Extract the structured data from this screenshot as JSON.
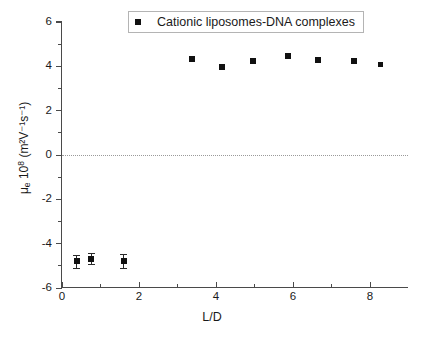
{
  "figure": {
    "legend": {
      "entries": [
        {
          "label": "Cationic liposomes-DNA complexes",
          "marker": "filled-square",
          "color": "#111111"
        }
      ]
    },
    "axes": {
      "x": {
        "title": "L/D",
        "major_ticks": [
          0,
          2,
          4,
          6,
          8
        ],
        "minor_ticks": [
          1,
          3,
          5,
          7
        ],
        "range": [
          0,
          9
        ]
      },
      "y": {
        "title_parts": {
          "symbol": "μ",
          "subscript": "e",
          "factor": "10",
          "exponent": "8",
          "units": "(m²V⁻¹s⁻¹)"
        },
        "title_plain": "μₑ 10⁸ (m²V⁻¹s⁻¹)",
        "major_ticks": [
          -6,
          -4,
          -2,
          0,
          2,
          4,
          6
        ],
        "minor_ticks": [
          -5,
          -3,
          -1,
          1,
          3,
          5
        ],
        "range": [
          -6,
          6
        ]
      }
    },
    "zero_reference_line": {
      "value": 0,
      "style": "dotted",
      "color": "#9a9a9a"
    }
  },
  "chart_data": {
    "type": "scatter",
    "title": "",
    "xlabel": "L/D",
    "ylabel": "μₑ 10⁸ (m²V⁻¹s⁻¹)",
    "xlim": [
      0,
      9
    ],
    "ylim": [
      -6,
      6
    ],
    "grid": false,
    "legend_position": "top-center",
    "series": [
      {
        "name": "Cationic liposomes-DNA complexes",
        "marker": "filled-square",
        "color": "#111111",
        "points": [
          {
            "x": 0.38,
            "y": -4.8,
            "yerr": 0.28
          },
          {
            "x": 0.76,
            "y": -4.68,
            "yerr": 0.25
          },
          {
            "x": 1.6,
            "y": -4.78,
            "yerr": 0.3
          },
          {
            "x": 3.38,
            "y": 4.35,
            "yerr": 0.0
          },
          {
            "x": 4.15,
            "y": 3.95,
            "yerr": 0.0
          },
          {
            "x": 4.96,
            "y": 4.22,
            "yerr": 0.0
          },
          {
            "x": 5.86,
            "y": 4.45,
            "yerr": 0.0
          },
          {
            "x": 6.65,
            "y": 4.28,
            "yerr": 0.0
          },
          {
            "x": 7.58,
            "y": 4.25,
            "yerr": 0.0
          },
          {
            "x": 8.28,
            "y": 4.1,
            "yerr": 0.0
          }
        ]
      }
    ]
  }
}
